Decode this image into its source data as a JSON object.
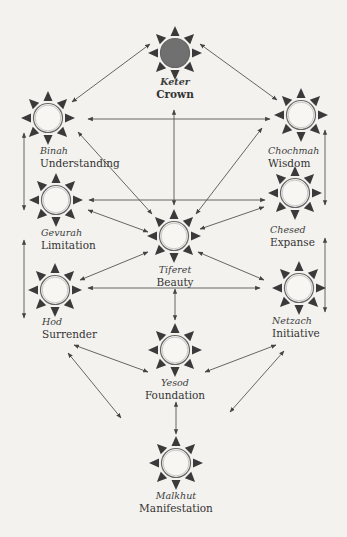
{
  "diagram": {
    "colors": {
      "background": "#f3f2ef",
      "line": "#555555",
      "ray": "#3a3a3a",
      "ring": "#666666",
      "keter_fill": "#707070",
      "node_fill": "#f7f6f3"
    },
    "nodes": [
      {
        "id": "keter",
        "hebrew": "Keter",
        "english": "Crown",
        "x": 175,
        "y": 53,
        "filled": true
      },
      {
        "id": "binah",
        "hebrew": "Binah",
        "english": "Understanding",
        "x": 48,
        "y": 118,
        "filled": false
      },
      {
        "id": "chochmah",
        "hebrew": "Chochmah",
        "english": "Wisdom",
        "x": 301,
        "y": 115,
        "filled": false
      },
      {
        "id": "gevurah",
        "hebrew": "Gevurah",
        "english": "Limitation",
        "x": 56,
        "y": 200,
        "filled": false
      },
      {
        "id": "chesed",
        "hebrew": "Chesed",
        "english": "Expanse",
        "x": 295,
        "y": 193,
        "filled": false
      },
      {
        "id": "tiferet",
        "hebrew": "Tiferet",
        "english": "Beauty",
        "x": 174,
        "y": 236,
        "filled": false
      },
      {
        "id": "hod",
        "hebrew": "Hod",
        "english": "Surrender",
        "x": 55,
        "y": 290,
        "filled": false
      },
      {
        "id": "netzach",
        "hebrew": "Netzach",
        "english": "Initiative",
        "x": 299,
        "y": 288,
        "filled": false
      },
      {
        "id": "yesod",
        "hebrew": "Yesod",
        "english": "Foundation",
        "x": 175,
        "y": 350,
        "filled": false
      },
      {
        "id": "malkhut",
        "hebrew": "Malkhut",
        "english": "Manifestation",
        "x": 176,
        "y": 463,
        "filled": false
      }
    ],
    "edges": [
      {
        "from": "keter",
        "to": "binah",
        "x1": 150,
        "y1": 44,
        "x2": 72,
        "y2": 102
      },
      {
        "from": "keter",
        "to": "chochmah",
        "x1": 200,
        "y1": 44,
        "x2": 277,
        "y2": 100
      },
      {
        "from": "keter",
        "to": "tiferet",
        "x1": 174,
        "y1": 110,
        "x2": 174,
        "y2": 205
      },
      {
        "from": "binah",
        "to": "chochmah",
        "x1": 88,
        "y1": 119,
        "x2": 270,
        "y2": 119
      },
      {
        "from": "binah",
        "to": "tiferet",
        "x1": 78,
        "y1": 132,
        "x2": 152,
        "y2": 214
      },
      {
        "from": "chochmah",
        "to": "tiferet",
        "x1": 262,
        "y1": 128,
        "x2": 196,
        "y2": 214
      },
      {
        "from": "binah",
        "to": "gevurah",
        "x1": 24,
        "y1": 133,
        "x2": 24,
        "y2": 210
      },
      {
        "from": "chochmah",
        "to": "chesed",
        "x1": 325,
        "y1": 130,
        "x2": 325,
        "y2": 205
      },
      {
        "from": "gevurah",
        "to": "chesed",
        "x1": 89,
        "y1": 200,
        "x2": 265,
        "y2": 200
      },
      {
        "from": "gevurah",
        "to": "tiferet",
        "x1": 88,
        "y1": 210,
        "x2": 148,
        "y2": 232
      },
      {
        "from": "chesed",
        "to": "tiferet",
        "x1": 264,
        "y1": 207,
        "x2": 200,
        "y2": 229
      },
      {
        "from": "gevurah",
        "to": "hod",
        "x1": 24,
        "y1": 240,
        "x2": 24,
        "y2": 318
      },
      {
        "from": "chesed",
        "to": "netzach",
        "x1": 325,
        "y1": 238,
        "x2": 325,
        "y2": 312
      },
      {
        "from": "tiferet",
        "to": "hod",
        "x1": 148,
        "y1": 252,
        "x2": 80,
        "y2": 280
      },
      {
        "from": "tiferet",
        "to": "netzach",
        "x1": 198,
        "y1": 252,
        "x2": 264,
        "y2": 280
      },
      {
        "from": "hod",
        "to": "netzach",
        "x1": 88,
        "y1": 288,
        "x2": 260,
        "y2": 288
      },
      {
        "from": "tiferet",
        "to": "yesod",
        "x1": 175,
        "y1": 289,
        "x2": 175,
        "y2": 320
      },
      {
        "from": "hod",
        "to": "yesod",
        "x1": 74,
        "y1": 345,
        "x2": 148,
        "y2": 372
      },
      {
        "from": "netzach",
        "to": "yesod",
        "x1": 276,
        "y1": 345,
        "x2": 205,
        "y2": 372
      },
      {
        "from": "hod",
        "to": "malkhut",
        "x1": 68,
        "y1": 353,
        "x2": 121,
        "y2": 418
      },
      {
        "from": "netzach",
        "to": "malkhut",
        "x1": 284,
        "y1": 351,
        "x2": 230,
        "y2": 412
      },
      {
        "from": "yesod",
        "to": "malkhut",
        "x1": 176,
        "y1": 402,
        "x2": 176,
        "y2": 434
      }
    ]
  }
}
